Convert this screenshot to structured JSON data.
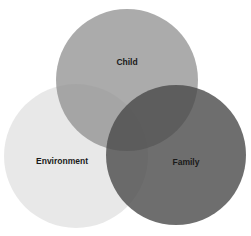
{
  "diagram": {
    "type": "venn",
    "sets": [
      {
        "id": "child",
        "label": "Child",
        "cx": 127,
        "cy": 80,
        "r": 71,
        "color": "#8f8f8f",
        "opacity": 0.75,
        "label_x": 127,
        "label_y": 65
      },
      {
        "id": "environment",
        "label": "Environment",
        "cx": 76,
        "cy": 156,
        "r": 72,
        "color": "#e2e2e2",
        "opacity": 0.8,
        "label_x": 62,
        "label_y": 164
      },
      {
        "id": "family",
        "label": "Family",
        "cx": 176,
        "cy": 155,
        "r": 70,
        "color": "#4a4a4a",
        "opacity": 0.8,
        "label_x": 186,
        "label_y": 165
      }
    ]
  }
}
